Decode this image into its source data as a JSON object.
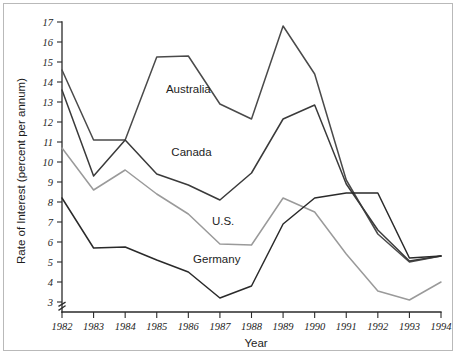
{
  "chart_data": {
    "type": "line",
    "title": "",
    "xlabel": "Year",
    "ylabel": "Rate of Interest (percent per annum)",
    "x": [
      1982,
      1983,
      1984,
      1985,
      1986,
      1987,
      1988,
      1989,
      1990,
      1991,
      1992,
      1993,
      1994
    ],
    "categories": [
      "1982",
      "1983",
      "1984",
      "1985",
      "1986",
      "1987",
      "1988",
      "1989",
      "1990",
      "1991",
      "1992",
      "1993",
      "1994"
    ],
    "xlim": [
      1982,
      1994
    ],
    "ylim": [
      3,
      17
    ],
    "yticks": [
      3,
      4,
      5,
      6,
      7,
      8,
      9,
      10,
      11,
      12,
      13,
      14,
      15,
      16,
      17
    ],
    "ytick_labels": [
      "3",
      "4",
      "5",
      "6",
      "7",
      "8",
      "9",
      "10",
      "11",
      "12",
      "13",
      "14",
      "15",
      "16",
      "17"
    ],
    "grid": false,
    "legend_position": "inline-labels",
    "axis_break": true,
    "series": [
      {
        "name": "Australia",
        "color": "#4a4a4a",
        "values": [
          14.6,
          11.1,
          11.1,
          15.25,
          15.3,
          12.9,
          12.15,
          16.8,
          14.4,
          9.1,
          6.4,
          5.0,
          5.3
        ],
        "label_x": 1986.0,
        "label_y": 13.45
      },
      {
        "name": "Canada",
        "color": "#3a3a3a",
        "values": [
          13.6,
          9.3,
          11.1,
          9.4,
          8.85,
          8.1,
          9.45,
          12.15,
          12.85,
          8.9,
          6.6,
          5.05,
          5.3
        ],
        "label_x": 1986.1,
        "label_y": 10.3
      },
      {
        "name": "U.S.",
        "color": "#9a9a9a",
        "values": [
          10.7,
          8.6,
          9.6,
          8.4,
          7.4,
          5.9,
          5.85,
          8.2,
          7.5,
          5.4,
          3.55,
          3.1,
          4.0
        ],
        "label_x": 1987.1,
        "label_y": 6.85
      },
      {
        "name": "Germany",
        "color": "#2a2a2a",
        "values": [
          8.2,
          5.7,
          5.75,
          5.1,
          4.5,
          3.2,
          3.8,
          6.9,
          8.2,
          8.45,
          8.45,
          5.2,
          5.3
        ],
        "label_x": 1986.9,
        "label_y": 4.95
      }
    ]
  },
  "axes": {
    "x_title": "Year",
    "y_title": "Rate of Interest (percent per annum)"
  }
}
